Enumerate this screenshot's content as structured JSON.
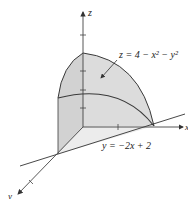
{
  "diagram": {
    "surface_label": "z = 4 − x² − y²",
    "plane_label": "y = −2x + 2",
    "axes": {
      "z": "z",
      "x": "x",
      "y": "y"
    },
    "colors": {
      "fill": "#d9d9d9",
      "stroke": "#3a3a3a",
      "axis": "#444444"
    }
  }
}
